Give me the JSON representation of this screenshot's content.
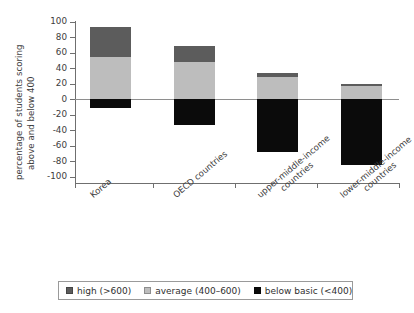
{
  "chart_data": {
    "type": "bar",
    "title": "",
    "subtitle": "",
    "xlabel": "",
    "ylabel_line1": "percentage of students scoring",
    "ylabel_line2": "above and below 400",
    "ylim": [
      -100,
      100
    ],
    "ytick_labels": [
      "100",
      "80",
      "60",
      "40",
      "20",
      "0",
      "-20",
      "-40",
      "-60",
      "-80",
      "-100"
    ],
    "ytick_values": [
      100,
      80,
      60,
      40,
      20,
      0,
      -20,
      -40,
      -60,
      -80,
      -100
    ],
    "grid": false,
    "legend_position": "bottom",
    "stacked": true,
    "zero_reference_line": true,
    "categories": [
      "Korea",
      "OECD countries",
      "upper-middle-income countries",
      "lower-middle-income countries"
    ],
    "category_label_lines": [
      [
        "Korea"
      ],
      [
        "OECD countries"
      ],
      [
        "upper-middle-income",
        "countries"
      ],
      [
        "lower-middle-income",
        "countries"
      ]
    ],
    "series": [
      {
        "name": "high (>600)",
        "color": "#5c5c5c",
        "values": [
          39,
          20,
          5,
          3
        ]
      },
      {
        "name": "average (400–600)",
        "color": "#bdbdbd",
        "values": [
          54,
          48,
          28,
          17
        ]
      },
      {
        "name": "below basic (<400)",
        "color": "#0b0b0b",
        "values": [
          -11,
          -33,
          -68,
          -85
        ]
      }
    ],
    "stack_tops": [
      93,
      68,
      33,
      20
    ],
    "stack_bottoms": [
      -11,
      -33,
      -68,
      -85
    ]
  },
  "legend": {
    "items": [
      {
        "label": "high (>600)",
        "color": "#5c5c5c"
      },
      {
        "label": "average (400–600)",
        "color": "#bdbdbd"
      },
      {
        "label": "below basic (<400)",
        "color": "#0b0b0b"
      }
    ]
  },
  "colors": {
    "high": "#5c5c5c",
    "average": "#bdbdbd",
    "below_basic": "#0b0b0b",
    "axis": "#6f6f6f",
    "zero_line": "#8e8e8e",
    "text": "#3d3d3d",
    "background": "#ffffff"
  }
}
